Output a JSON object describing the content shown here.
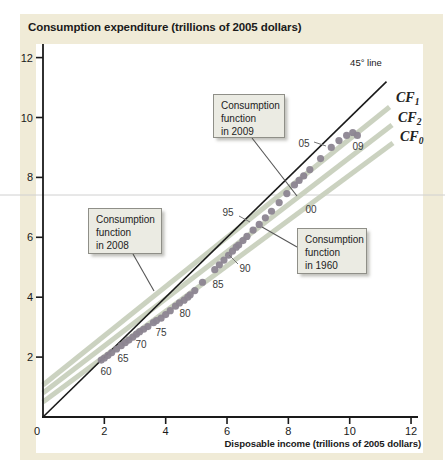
{
  "figure": {
    "title": "Consumption expenditure (trillions of 2005 dollars)",
    "x_title": "Disposable income (trillions of 2005 dollars)"
  },
  "colors": {
    "card_bg": "#f0ebd7",
    "plot_bg": "#ffffff",
    "axis": "#1a1a1a",
    "cf_line": "#cbd2c0",
    "line45": "#1a1a1a",
    "dot": "#8c8591",
    "callout_bg": "#ebebe3",
    "callout_border": "#8f8f88",
    "leader": "#555555",
    "hairline": "#d0d0d0"
  },
  "decor": {
    "hairline_y": 195
  },
  "chart_data": {
    "type": "scatter",
    "title": "Consumption expenditure (trillions of 2005 dollars)",
    "xlabel": "Disposable income (trillions of 2005 dollars)",
    "ylabel": "Consumption expenditure (trillions of 2005 dollars)",
    "xlim": [
      0,
      12.3
    ],
    "ylim": [
      0,
      12.4
    ],
    "x_ticks": [
      0,
      2,
      4,
      6,
      8,
      10,
      12
    ],
    "y_ticks": [
      2,
      4,
      6,
      8,
      10,
      12
    ],
    "grid": false,
    "series": [
      {
        "name": "US disposable income vs consumption expenditure, annually 1960-2009",
        "marker": "circle",
        "points": [
          [
            1.9,
            1.9
          ],
          [
            2.0,
            1.97
          ],
          [
            2.12,
            2.06
          ],
          [
            2.24,
            2.15
          ],
          [
            2.4,
            2.27
          ],
          [
            2.55,
            2.38
          ],
          [
            2.68,
            2.48
          ],
          [
            2.8,
            2.57
          ],
          [
            2.93,
            2.67
          ],
          [
            3.05,
            2.77
          ],
          [
            3.15,
            2.85
          ],
          [
            3.28,
            2.93
          ],
          [
            3.42,
            3.02
          ],
          [
            3.6,
            3.15
          ],
          [
            3.7,
            3.22
          ],
          [
            3.85,
            3.3
          ],
          [
            4.0,
            3.42
          ],
          [
            4.15,
            3.55
          ],
          [
            4.32,
            3.7
          ],
          [
            4.45,
            3.81
          ],
          [
            4.6,
            3.9
          ],
          [
            4.72,
            4.0
          ],
          [
            4.8,
            4.08
          ],
          [
            4.95,
            4.22
          ],
          [
            5.2,
            4.5
          ],
          [
            5.6,
            4.92
          ],
          [
            5.75,
            5.08
          ],
          [
            5.9,
            5.24
          ],
          [
            6.05,
            5.4
          ],
          [
            6.18,
            5.54
          ],
          [
            6.3,
            5.67
          ],
          [
            6.38,
            5.74
          ],
          [
            6.52,
            5.89
          ],
          [
            6.65,
            6.03
          ],
          [
            6.85,
            6.24
          ],
          [
            7.05,
            6.43
          ],
          [
            7.25,
            6.65
          ],
          [
            7.45,
            6.87
          ],
          [
            7.7,
            7.16
          ],
          [
            7.95,
            7.46
          ],
          [
            8.2,
            7.75
          ],
          [
            8.35,
            7.9
          ],
          [
            8.5,
            8.05
          ],
          [
            8.7,
            8.26
          ],
          [
            9.05,
            8.63
          ],
          [
            9.4,
            9.0
          ],
          [
            9.65,
            9.23
          ],
          [
            9.9,
            9.4
          ],
          [
            10.1,
            9.5
          ],
          [
            10.25,
            9.4
          ]
        ]
      }
    ],
    "lines": [
      {
        "name": "cf1-line",
        "label": "CF",
        "sub": "1",
        "style": "thick-green",
        "x1": 0,
        "y1": 1.07,
        "x2": 11.3,
        "y2": 10.35,
        "label_px": [
          396,
          102
        ]
      },
      {
        "name": "cf2-line",
        "label": "CF",
        "sub": "2",
        "style": "thick-green",
        "x1": 0,
        "y1": 0.8,
        "x2": 11.38,
        "y2": 9.75,
        "label_px": [
          398,
          122
        ]
      },
      {
        "name": "cf0-line",
        "label": "CF",
        "sub": "0",
        "style": "thick-green",
        "x1": 0,
        "y1": 0.5,
        "x2": 11.41,
        "y2": 9.15,
        "label_px": [
          400,
          141
        ]
      },
      {
        "name": "45-degree-line",
        "label": "45° line",
        "sub": "",
        "style": "thin-black",
        "x1": 0,
        "y1": 0,
        "x2": 11.2,
        "y2": 11.2,
        "label_px": [
          366,
          66
        ]
      }
    ],
    "point_labels": [
      {
        "text": "60",
        "px": [
          106,
          371
        ]
      },
      {
        "text": "65",
        "px": [
          123,
          358
        ]
      },
      {
        "text": "70",
        "px": [
          141,
          344
        ]
      },
      {
        "text": "75",
        "px": [
          161,
          332
        ]
      },
      {
        "text": "80",
        "px": [
          185,
          313
        ]
      },
      {
        "text": "85",
        "px": [
          218,
          284
        ]
      },
      {
        "text": "90",
        "px": [
          245,
          268
        ],
        "leader": [
          [
            238,
            264
          ],
          [
            229,
            255
          ]
        ]
      },
      {
        "text": "95",
        "px": [
          228,
          212
        ],
        "leader": [
          [
            239,
            216
          ],
          [
            250,
            222
          ]
        ]
      },
      {
        "text": "00",
        "px": [
          311,
          209
        ]
      },
      {
        "text": "05",
        "px": [
          304,
          143
        ],
        "leader": [
          [
            314,
            142
          ],
          [
            326,
            146
          ]
        ]
      },
      {
        "text": "09",
        "px": [
          358,
          146
        ]
      }
    ],
    "callouts": [
      {
        "name": "callout-2009",
        "text": "Consumption function in 2009",
        "lines": [
          "Consumption",
          "function",
          "in 2009"
        ],
        "box": [
          213,
          94,
          72,
          44
        ],
        "leader": [
          [
            252,
            138
          ],
          [
            297,
            196
          ]
        ]
      },
      {
        "name": "callout-2008",
        "text": "Consumption function in 2008",
        "lines": [
          "Consumption",
          "function",
          "in 2008"
        ],
        "box": [
          88,
          208,
          74,
          46
        ],
        "leader": [
          [
            133,
            254
          ],
          [
            154,
            291
          ]
        ]
      },
      {
        "name": "callout-1960",
        "text": "Consumption function in 1960",
        "lines": [
          "Consumption",
          "function",
          "in 1960"
        ],
        "box": [
          297,
          228,
          70,
          46
        ],
        "leader": [
          [
            297,
            247
          ],
          [
            262,
            227
          ]
        ]
      }
    ]
  }
}
